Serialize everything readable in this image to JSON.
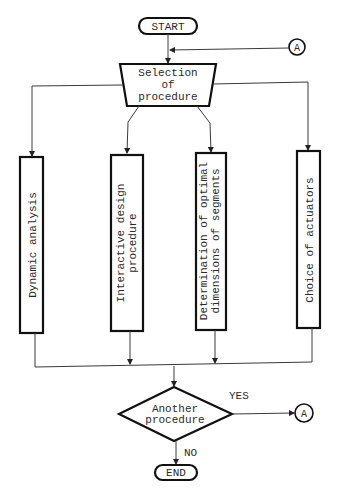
{
  "diagram": {
    "type": "flowchart",
    "nodes": {
      "start": {
        "label": "START",
        "shape": "terminator"
      },
      "selection": {
        "lines": [
          "Selection",
          "of",
          "procedure"
        ],
        "shape": "manual-operation-trapezoid"
      },
      "connector_top": {
        "label": "A",
        "shape": "connector-circle"
      },
      "proc1": {
        "lines": [
          "Dynamic analysis"
        ],
        "shape": "process",
        "orientation": "vertical"
      },
      "proc2": {
        "lines": [
          "Interactive design",
          "procedure"
        ],
        "shape": "process",
        "orientation": "vertical"
      },
      "proc3": {
        "lines": [
          "Determination of optimal",
          "dimensions of segments"
        ],
        "shape": "process",
        "orientation": "vertical"
      },
      "proc4": {
        "lines": [
          "Choice of actuators"
        ],
        "shape": "process",
        "orientation": "vertical"
      },
      "decision": {
        "lines": [
          "Another",
          "procedure"
        ],
        "shape": "decision"
      },
      "connector_right": {
        "label": "A",
        "shape": "connector-circle"
      },
      "end": {
        "label": "END",
        "shape": "terminator"
      }
    },
    "edge_labels": {
      "yes": "YES",
      "no": "NO"
    },
    "edges": [
      {
        "from": "start",
        "to": "selection"
      },
      {
        "from": "connector_top",
        "to": "selection"
      },
      {
        "from": "selection",
        "to": "proc1"
      },
      {
        "from": "selection",
        "to": "proc2"
      },
      {
        "from": "selection",
        "to": "proc3"
      },
      {
        "from": "selection",
        "to": "proc4"
      },
      {
        "from": "proc1",
        "to": "decision"
      },
      {
        "from": "proc2",
        "to": "decision"
      },
      {
        "from": "proc3",
        "to": "decision"
      },
      {
        "from": "proc4",
        "to": "decision"
      },
      {
        "from": "decision",
        "to": "connector_right",
        "label": "YES"
      },
      {
        "from": "decision",
        "to": "end",
        "label": "NO"
      }
    ]
  }
}
